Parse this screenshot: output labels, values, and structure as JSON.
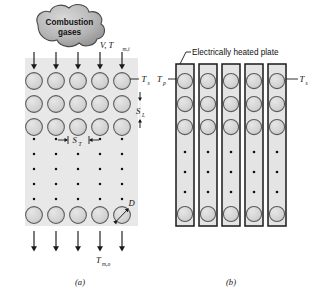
{
  "figure": {
    "type": "engineering-schematic"
  },
  "panel_a": {
    "caption": "(a)",
    "cloud_label_line1": "Combustion",
    "cloud_label_line2": "gases",
    "inlet_label": "V, T",
    "inlet_sub": "m,i",
    "surface_temp_label": "T",
    "surface_temp_sub": "s",
    "longitudinal_pitch_label": "S",
    "longitudinal_pitch_sub": "L",
    "transverse_pitch_label": "S",
    "transverse_pitch_sub": "T",
    "diameter_label": "D",
    "outlet_label": "T",
    "outlet_sub": "m,o",
    "arrow_count_top": 5,
    "arrow_count_bottom": 5,
    "tube_rows_top": 3,
    "tube_rows_bottom": 1,
    "tube_columns": 5,
    "dot_rows": 5,
    "dot_columns": 5
  },
  "panel_b": {
    "caption": "(b)",
    "plate_label": "Electrically heated plate",
    "plate_temp_label": "T",
    "plate_temp_sub": "p",
    "surface_temp_label": "T",
    "surface_temp_sub": "s",
    "plate_count": 5,
    "circles_per_plate_top": 3,
    "circles_per_plate_bottom": 1,
    "dots_per_plate": 3
  },
  "colors": {
    "panel_fill": "#e8e8e8",
    "plate_fill": "#e4e4e4",
    "circle_fill": "#d6d6d6",
    "circle_stroke": "#5a5a5a",
    "line": "#1a1a1a",
    "cloud_fill": "#b9b9b9",
    "cloud_stroke": "#4a4a4a",
    "cloud_text": "#111111",
    "dot": "#111111",
    "background": "#ffffff"
  }
}
